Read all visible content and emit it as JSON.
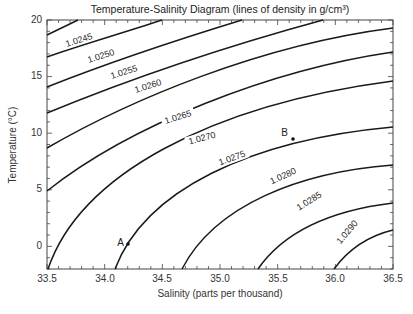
{
  "chart_data": {
    "type": "line",
    "title": "Temperature-Salinity Diagram (lines of density in g/cm³)",
    "xlabel": "Salinity (parts per thousand)",
    "ylabel": "Temperature (°C)",
    "xlim": [
      33.5,
      36.5
    ],
    "ylim": [
      -2,
      20
    ],
    "x_ticks": [
      "33.5",
      "34.0",
      "34.5",
      "35.0",
      "35.5",
      "36.0",
      "36.5"
    ],
    "y_ticks": [
      "0",
      "5",
      "10",
      "15",
      "20"
    ],
    "grid": false,
    "legend": null,
    "series": [
      {
        "name": "1.0240",
        "label_shown": false,
        "points": [
          [
            33.5,
            19.1
          ],
          [
            33.77,
            20
          ]
        ]
      },
      {
        "name": "1.0245",
        "label_shown": true,
        "points": [
          [
            33.5,
            17.3
          ],
          [
            33.9,
            18.7
          ],
          [
            34.3,
            20
          ]
        ]
      },
      {
        "name": "1.0250",
        "label_shown": true,
        "points": [
          [
            33.5,
            14.7
          ],
          [
            34.0,
            16.6
          ],
          [
            34.5,
            18.2
          ],
          [
            35.0,
            20
          ]
        ]
      },
      {
        "name": "1.0255",
        "label_shown": true,
        "points": [
          [
            33.5,
            12.5
          ],
          [
            34.0,
            14.4
          ],
          [
            34.5,
            16.1
          ],
          [
            35.0,
            17.9
          ],
          [
            35.7,
            20
          ]
        ]
      },
      {
        "name": "1.0260",
        "label_shown": true,
        "points": [
          [
            33.5,
            9.3
          ],
          [
            34.0,
            11.7
          ],
          [
            34.5,
            13.9
          ],
          [
            35.0,
            15.8
          ],
          [
            35.5,
            17.6
          ],
          [
            36.0,
            19.0
          ],
          [
            36.5,
            19.3
          ]
        ]
      },
      {
        "name": "1.0265",
        "label_shown": true,
        "points": [
          [
            33.5,
            5.0
          ],
          [
            34.0,
            8.1
          ],
          [
            34.5,
            10.8
          ],
          [
            35.0,
            13.1
          ],
          [
            35.5,
            15.1
          ],
          [
            36.0,
            16.6
          ],
          [
            36.5,
            17.2
          ]
        ]
      },
      {
        "name": "1.0270",
        "label_shown": true,
        "points": [
          [
            33.5,
            -2.0
          ],
          [
            33.8,
            2.0
          ],
          [
            34.2,
            5.5
          ],
          [
            34.7,
            8.8
          ],
          [
            35.2,
            11.4
          ],
          [
            35.8,
            13.5
          ],
          [
            36.5,
            14.6
          ]
        ]
      },
      {
        "name": "1.0275",
        "label_shown": true,
        "points": [
          [
            34.08,
            -2.0
          ],
          [
            34.2,
            0.2
          ],
          [
            34.5,
            3.7
          ],
          [
            35.0,
            7.0
          ],
          [
            35.64,
            9.6
          ],
          [
            36.1,
            10.8
          ],
          [
            36.5,
            10.6
          ]
        ]
      },
      {
        "name": "1.0280",
        "label_shown": true,
        "points": [
          [
            34.66,
            -2.0
          ],
          [
            34.9,
            1.5
          ],
          [
            35.3,
            4.3
          ],
          [
            35.8,
            6.3
          ],
          [
            36.2,
            7.0
          ],
          [
            36.5,
            7.2
          ]
        ]
      },
      {
        "name": "1.0285",
        "label_shown": true,
        "points": [
          [
            35.32,
            -2.0
          ],
          [
            35.5,
            0.3
          ],
          [
            35.8,
            2.4
          ],
          [
            36.2,
            3.5
          ],
          [
            36.5,
            3.9
          ]
        ]
      },
      {
        "name": "1.0290",
        "label_shown": true,
        "points": [
          [
            35.98,
            -2.0
          ],
          [
            36.1,
            -0.7
          ],
          [
            36.3,
            0.7
          ],
          [
            36.5,
            1.5
          ]
        ]
      }
    ],
    "annotations": [
      {
        "label": "A",
        "salinity": 34.2,
        "temperature": 0.2
      },
      {
        "label": "B",
        "salinity": 35.64,
        "temperature": 9.6
      }
    ]
  },
  "labels": {
    "title": "Temperature-Salinity Diagram (lines of density in g/cm³)",
    "xlabel": "Salinity (parts per thousand)",
    "ylabel": "Temperature (°C)",
    "x_ticks": [
      "33.5",
      "34.0",
      "34.5",
      "35.0",
      "35.5",
      "36.0",
      "36.5"
    ],
    "y_ticks": [
      "0",
      "5",
      "10",
      "15",
      "20"
    ],
    "contours": [
      "1.0245",
      "1.0250",
      "1.0255",
      "1.0260",
      "1.0265",
      "1.0270",
      "1.0275",
      "1.0280",
      "1.0285",
      "1.0290"
    ],
    "point_a": "A",
    "point_b": "B"
  }
}
